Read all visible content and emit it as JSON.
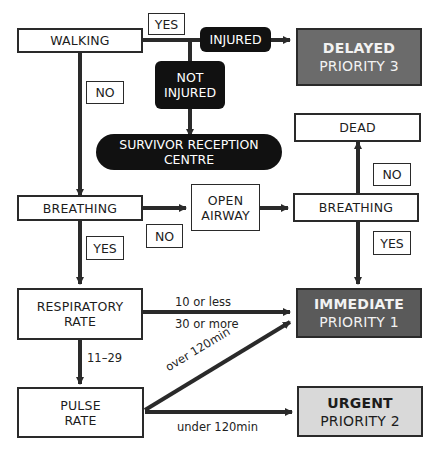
{
  "nodes": {
    "walking": "WALKING",
    "injured": "INJURED",
    "not_injured_1": "NOT",
    "not_injured_2": "INJURED",
    "delayed_title": "DELAYED",
    "delayed_priority": "PRIORITY 3",
    "survivor_1": "SURVIVOR RECEPTION",
    "survivor_2": "CENTRE",
    "dead": "DEAD",
    "breathing_left": "BREATHING",
    "open_airway_1": "OPEN",
    "open_airway_2": "AIRWAY",
    "breathing_right": "BREATHING",
    "resp_1": "RESPIRATORY",
    "resp_2": "RATE",
    "immediate_title": "IMMEDIATE",
    "immediate_priority": "PRIORITY 1",
    "pulse_1": "PULSE",
    "pulse_2": "RATE",
    "urgent_title": "URGENT",
    "urgent_priority": "PRIORITY 2"
  },
  "labels": {
    "walking_yes": "YES",
    "walking_no": "NO",
    "breathing_no": "NO",
    "breathing_yes": "YES",
    "breathing2_no": "NO",
    "breathing2_yes": "YES",
    "resp_low": "10 or less",
    "resp_high": "30 or more",
    "resp_normal": "11–29",
    "pulse_over": "over 120min",
    "pulse_under": "under 120min"
  },
  "colors": {
    "delayed_bg": "#6b6b6b",
    "immediate_bg": "#5a5a5a",
    "urgent_bg": "#d9d9d9",
    "black_node": "#111111",
    "line": "#2a2a2a"
  }
}
